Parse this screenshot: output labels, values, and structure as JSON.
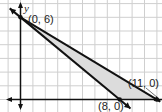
{
  "chart_data": {
    "type": "area",
    "title": "",
    "xlabel": "",
    "ylabel": "y",
    "grid": true,
    "lines": [
      {
        "name": "boundary-1",
        "points": [
          [
            0,
            6
          ],
          [
            8,
            0
          ]
        ]
      },
      {
        "name": "boundary-2",
        "points": [
          [
            0,
            6
          ],
          [
            11,
            0
          ]
        ]
      }
    ],
    "shaded_region": [
      [
        0,
        6
      ],
      [
        8,
        0
      ],
      [
        11,
        0
      ]
    ],
    "points": [
      {
        "label": "(0, 6)",
        "x": 0,
        "y": 6
      },
      {
        "label": "(8, 0)",
        "x": 8,
        "y": 0
      },
      {
        "label": "(11, 0)",
        "x": 11,
        "y": 0
      }
    ],
    "colors": {
      "shade": "#d9d9d9",
      "line": "#111111",
      "grid": "#cccccc"
    }
  },
  "labels": {
    "y_axis": "y",
    "p1": "(0, 6)",
    "p2": "(8, 0)",
    "p3": "(11, 0)"
  }
}
